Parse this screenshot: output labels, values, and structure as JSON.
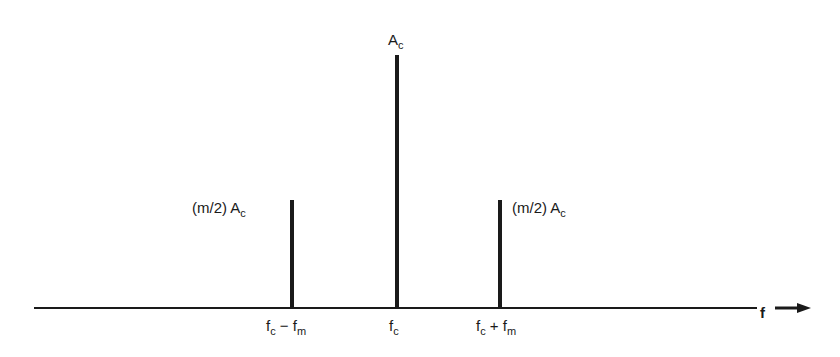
{
  "diagram": {
    "type": "AM frequency spectrum",
    "axis_label": "f",
    "spikes": [
      {
        "id": "lower-sideband",
        "label_main": "(m/2) A",
        "label_sub": "c",
        "freq_main": "f",
        "freq_sub1": "c",
        "freq_op": " − f",
        "freq_sub2": "m"
      },
      {
        "id": "carrier",
        "label_main": "A",
        "label_sub": "c",
        "freq_main": "f",
        "freq_sub1": "c"
      },
      {
        "id": "upper-sideband",
        "label_main": "(m/2) A",
        "label_sub": "c",
        "freq_main": "f",
        "freq_sub1": "c",
        "freq_op": " + f",
        "freq_sub2": "m"
      }
    ]
  }
}
